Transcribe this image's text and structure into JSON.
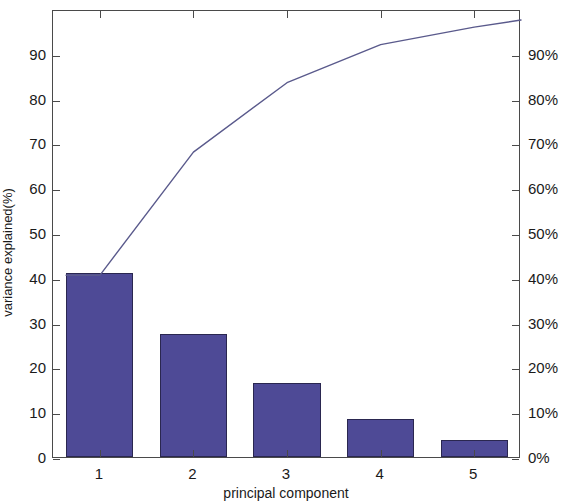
{
  "chart_data": {
    "type": "bar",
    "title": "",
    "subtitle": "",
    "xlabel": "principal component",
    "ylabel": "variance explained(%)",
    "categories": [
      "1",
      "2",
      "3",
      "4",
      "5"
    ],
    "values": [
      41.0,
      27.5,
      16.5,
      8.5,
      3.9
    ],
    "series": [
      {
        "name": "variance explained",
        "type": "bar",
        "values": [
          41.0,
          27.5,
          16.5,
          8.5,
          3.9
        ]
      },
      {
        "name": "cumulative variance explained",
        "type": "line",
        "values": [
          41.0,
          68.5,
          84.0,
          92.5,
          96.4
        ]
      }
    ],
    "ylim": [
      0,
      100
    ],
    "yticks": [
      0,
      10,
      20,
      30,
      40,
      50,
      60,
      70,
      80,
      90
    ],
    "ytick_labels": [
      "0",
      "10",
      "20",
      "30",
      "40",
      "50",
      "60",
      "70",
      "80",
      "90"
    ],
    "y2lim": [
      0,
      100
    ],
    "y2ticks": [
      0,
      10,
      20,
      30,
      40,
      50,
      60,
      70,
      80,
      90
    ],
    "y2tick_labels": [
      "0%",
      "10%",
      "20%",
      "30%",
      "40%",
      "50%",
      "60%",
      "70%",
      "80%",
      "90%"
    ],
    "y2label": "",
    "xtick_labels": [
      "1",
      "2",
      "3",
      "4",
      "5"
    ],
    "grid": false,
    "legend": "none",
    "bar_color": "#4e4a96",
    "bar_edge_color": "#2a2750",
    "line_color": "#5a5a8c",
    "axis_color": "#4a4a4a",
    "background": "#ffffff"
  },
  "axes": {
    "left_title": "variance explained(%)",
    "bottom_title": "principal component"
  }
}
